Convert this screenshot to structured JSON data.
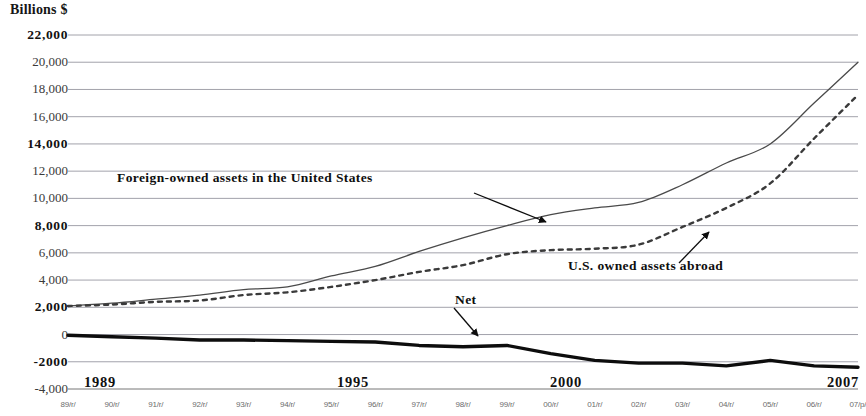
{
  "chart_data": {
    "type": "line",
    "title": "",
    "ylabel": "Billions $",
    "xlabel": "",
    "ylim": [
      -4000,
      22000
    ],
    "grid": true,
    "legend_position": "inline-annotations",
    "ytick_labels": [
      "22,000",
      "20,000",
      "18,000",
      "16,000",
      "14,000",
      "12,000",
      "10,000",
      "8,000",
      "6,000",
      "4,000",
      "2,000",
      "0",
      "-2000",
      "-4,000"
    ],
    "ytick_values": [
      22000,
      20000,
      18000,
      16000,
      14000,
      12000,
      10000,
      8000,
      6000,
      4000,
      2000,
      0,
      -2000,
      -4000
    ],
    "ytick_bold": [
      true,
      false,
      false,
      false,
      true,
      false,
      false,
      true,
      false,
      false,
      true,
      false,
      true,
      false
    ],
    "x_major_labels": [
      "1989",
      "1995",
      "2000",
      "2007"
    ],
    "x_major_values": [
      1989,
      1995,
      2000,
      2007
    ],
    "x_minor_labels": [
      "89/r/",
      "90/r/",
      "91/r/",
      "92/r/",
      "93/r/",
      "94/r/",
      "95/r/",
      "96/r/",
      "97/r/",
      "98/r/",
      "99/r/",
      "00/r/",
      "01/r/",
      "02/r/",
      "03/r/",
      "04/r/",
      "05/r/",
      "06/r/",
      "07/p/"
    ],
    "x": [
      1989,
      1990,
      1991,
      1992,
      1993,
      1994,
      1995,
      1996,
      1997,
      1998,
      1999,
      2000,
      2001,
      2002,
      2003,
      2004,
      2005,
      2006,
      2007
    ],
    "series": [
      {
        "name": "Foreign-owned assets in the United States",
        "style": "solid",
        "color": "#4a4a4a",
        "values": [
          2100,
          2300,
          2600,
          2900,
          3300,
          3500,
          4300,
          5000,
          6100,
          7100,
          8000,
          8800,
          9300,
          9700,
          11000,
          12600,
          14000,
          17000,
          20000
        ]
      },
      {
        "name": "U.S. owned assets abroad",
        "style": "dotted",
        "color": "#3a3a3a",
        "values": [
          2100,
          2200,
          2400,
          2500,
          2900,
          3100,
          3500,
          4000,
          4600,
          5100,
          5900,
          6200,
          6300,
          6600,
          7900,
          9300,
          11100,
          14400,
          17600
        ]
      },
      {
        "name": "Net",
        "style": "thick-solid",
        "color": "#0d0d0d",
        "values": [
          -50,
          -160,
          -260,
          -400,
          -400,
          -450,
          -500,
          -550,
          -800,
          -900,
          -800,
          -1400,
          -1900,
          -2100,
          -2100,
          -2300,
          -1900,
          -2300,
          -2400
        ]
      }
    ],
    "annotations": [
      {
        "text": "Foreign-owned assets in the United States",
        "x": 1991.6,
        "y": 11500
      },
      {
        "text": "U.S. owned assets abroad",
        "x": 2001.4,
        "y": 5200
      },
      {
        "text": "Net",
        "x": 1997.6,
        "y": 1600
      }
    ]
  }
}
